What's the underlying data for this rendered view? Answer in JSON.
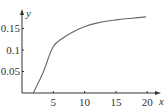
{
  "chart_data": {
    "type": "line",
    "title": "",
    "xlabel": "x",
    "ylabel": "y",
    "xlim": [
      0,
      21
    ],
    "ylim": [
      0,
      0.19
    ],
    "x_ticks": [
      "5",
      "10",
      "15",
      "20"
    ],
    "y_ticks": [
      "0.05",
      "0.1",
      "0.15"
    ],
    "grid": false,
    "legend": null,
    "series": [
      {
        "name": "curve",
        "x": [
          1.8,
          3.35,
          4.95,
          6.55,
          8.15,
          9.75,
          12.1,
          15.0,
          17.5,
          19.8
        ],
        "y": [
          0.0,
          0.047,
          0.107,
          0.128,
          0.142,
          0.153,
          0.163,
          0.17,
          0.174,
          0.177
        ]
      }
    ],
    "colors": {
      "axis": "#333333",
      "curve": "#666666"
    }
  }
}
